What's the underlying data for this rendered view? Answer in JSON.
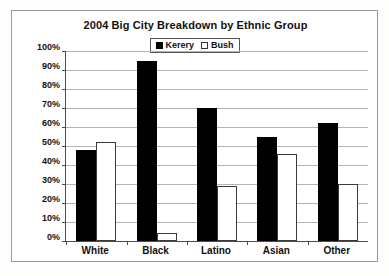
{
  "chart_data": {
    "type": "bar",
    "title": "2004 Big City Breakdown by Ethnic Group",
    "xlabel": "",
    "ylabel": "",
    "ylim": [
      0,
      100
    ],
    "ytick_labels": [
      "100%",
      "90%",
      "80%",
      "70%",
      "60%",
      "50%",
      "40%",
      "30%",
      "20%",
      "10%",
      "0%"
    ],
    "ytick_values": [
      100,
      90,
      80,
      70,
      60,
      50,
      40,
      30,
      20,
      10,
      0
    ],
    "grid": true,
    "legend_position": "top-center",
    "categories": [
      "White",
      "Black",
      "Latino",
      "Asian",
      "Other"
    ],
    "series": [
      {
        "name": "Kerery",
        "color": "#000000",
        "style": "filled",
        "values": [
          48,
          95,
          70,
          55,
          62
        ]
      },
      {
        "name": "Bush",
        "color": "#ffffff",
        "style": "hollow",
        "values": [
          52,
          4,
          29,
          46,
          30
        ]
      }
    ]
  },
  "colors": {
    "axis": "#4d4d4d",
    "gridline": "#b4b4b4",
    "frame": "#9a9a9a",
    "text": "#111111",
    "background": "#ffffff"
  }
}
